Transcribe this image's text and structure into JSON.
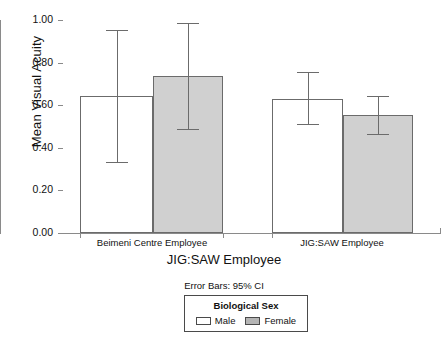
{
  "chart_data": {
    "type": "bar",
    "title": "",
    "xlabel": "JIG:SAW Employee",
    "ylabel": "Mean Visual Acuity",
    "categories": [
      "Beimeni Centre Employee",
      "JIG:SAW Employee"
    ],
    "ylim": [
      0.0,
      1.0
    ],
    "ytick_labels": [
      "0.00",
      "0.20",
      "0.40",
      "0.60",
      "0.80",
      "1.00"
    ],
    "ytick_values": [
      0.0,
      0.2,
      0.4,
      0.6,
      0.8,
      1.0
    ],
    "grid": false,
    "legend_position": "bottom",
    "legend_title": "Biological Sex",
    "error_bar_note": "Error Bars: 95% CI",
    "series": [
      {
        "name": "Male",
        "color": "#ffffff",
        "values": [
          0.645,
          0.63
        ],
        "ci_low": [
          0.335,
          0.512
        ],
        "ci_high": [
          0.955,
          0.755
        ]
      },
      {
        "name": "Female",
        "color": "#d0d0d0",
        "values": [
          0.735,
          0.552
        ],
        "ci_low": [
          0.488,
          0.467
        ],
        "ci_high": [
          0.985,
          0.642
        ]
      }
    ]
  },
  "axes": {
    "y_title": "Mean Visual Acuity",
    "x_title": "JIG:SAW Employee",
    "y_ticks": [
      {
        "label": "1.00"
      },
      {
        "label": "0.80"
      },
      {
        "label": "0.60"
      },
      {
        "label": "0.40"
      },
      {
        "label": "0.20"
      },
      {
        "label": "0.00"
      }
    ],
    "categories": [
      {
        "label": "Beimeni Centre Employee"
      },
      {
        "label": "JIG:SAW Employee"
      }
    ]
  },
  "footnote": {
    "error_bars": "Error Bars: 95% CI"
  },
  "legend": {
    "title": "Biological Sex",
    "items": [
      {
        "label": "Male"
      },
      {
        "label": "Female"
      }
    ]
  }
}
